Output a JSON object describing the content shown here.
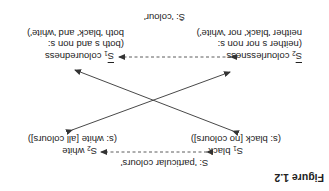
{
  "figure": {
    "title": "Figure 1.2",
    "top_label": "S: 'particular colours'",
    "s1": {
      "sym": "S",
      "sub": "1",
      "label": " black"
    },
    "s2": {
      "sym": "S",
      "sub": "2",
      "label": " white"
    },
    "s1_desc": "(s: black [no colours])",
    "s2_desc": "(s: white [all colours])",
    "nb2": {
      "sym": "S",
      "sub": "2",
      "label": " colourlessness"
    },
    "nb1": {
      "sym": "S",
      "sub": "1",
      "label": " colouredness"
    },
    "nb2_desc_1": "(neither s nor non s:",
    "nb2_desc_2": "neither 'black' nor 'white')",
    "nb1_desc_1": "(both s and non s:",
    "nb1_desc_2": "both 'black' and 'white')",
    "bottom_label": "S̄: 'colour'",
    "rotation_deg": 180,
    "line_color": "#333333"
  }
}
